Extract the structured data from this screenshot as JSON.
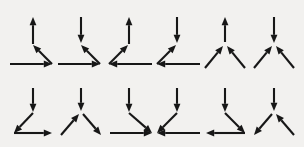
{
  "figure": {
    "background_color": "#f2f1ef",
    "stroke_color": "#171717",
    "stroke_width": 2.1,
    "canvas": {
      "width": 304,
      "height": 147
    },
    "rows": 2,
    "columns": 6,
    "item_count": 12
  },
  "items": [
    {
      "index": 1,
      "row": 1,
      "column": 1,
      "name": "junction-1",
      "vertex": {
        "x": 52,
        "y": 64
      },
      "segments": [
        {
          "name": "vertical-up-arrow",
          "direction": "up",
          "from": [
            33,
            44
          ],
          "to": [
            33,
            17
          ],
          "head": "end"
        },
        {
          "name": "diagonal-up-left-arrow",
          "direction": "up-left",
          "from": [
            52,
            64
          ],
          "to": [
            33,
            45
          ],
          "head": "end"
        },
        {
          "name": "horizontal-right-arrow",
          "direction": "right",
          "from": [
            10,
            64
          ],
          "to": [
            52,
            64
          ],
          "head": "end"
        }
      ]
    },
    {
      "index": 2,
      "row": 1,
      "column": 2,
      "name": "junction-2",
      "vertex": {
        "x": 100,
        "y": 64
      },
      "segments": [
        {
          "name": "vertical-down-arrow",
          "direction": "down",
          "from": [
            81,
            17
          ],
          "to": [
            81,
            43
          ],
          "head": "end"
        },
        {
          "name": "diagonal-up-left-arrow",
          "direction": "up-left",
          "from": [
            100,
            64
          ],
          "to": [
            81,
            45
          ],
          "head": "end"
        },
        {
          "name": "horizontal-right-arrow",
          "direction": "right",
          "from": [
            58,
            64
          ],
          "to": [
            100,
            64
          ],
          "head": "end"
        }
      ]
    },
    {
      "index": 3,
      "row": 1,
      "column": 3,
      "name": "junction-3",
      "vertex": {
        "x": 109,
        "y": 64
      },
      "segments": [
        {
          "name": "vertical-up-arrow",
          "direction": "up",
          "from": [
            129,
            44
          ],
          "to": [
            129,
            17
          ],
          "head": "end"
        },
        {
          "name": "diagonal-up-right-arrow",
          "direction": "up-right",
          "from": [
            109,
            64
          ],
          "to": [
            128,
            45
          ],
          "head": "end"
        },
        {
          "name": "horizontal-left-arrow",
          "direction": "left",
          "from": [
            152,
            64
          ],
          "to": [
            109,
            64
          ],
          "head": "end"
        }
      ]
    },
    {
      "index": 4,
      "row": 1,
      "column": 4,
      "name": "junction-4",
      "vertex": {
        "x": 157,
        "y": 64
      },
      "segments": [
        {
          "name": "vertical-down-arrow",
          "direction": "down",
          "from": [
            177,
            17
          ],
          "to": [
            177,
            43
          ],
          "head": "end"
        },
        {
          "name": "diagonal-up-right-arrow",
          "direction": "up-right",
          "from": [
            157,
            64
          ],
          "to": [
            176,
            45
          ],
          "head": "end"
        },
        {
          "name": "horizontal-left-arrow",
          "direction": "left",
          "from": [
            200,
            64
          ],
          "to": [
            157,
            64
          ],
          "head": "end"
        }
      ]
    },
    {
      "index": 5,
      "row": 1,
      "column": 5,
      "name": "junction-5",
      "vertex": {
        "x": 225,
        "y": 44
      },
      "segments": [
        {
          "name": "vertical-up-arrow",
          "direction": "up",
          "from": [
            225,
            42
          ],
          "to": [
            225,
            17
          ],
          "head": "end"
        },
        {
          "name": "diagonal-up-right-arrow",
          "direction": "up-right",
          "from": [
            205,
            68
          ],
          "to": [
            223,
            46
          ],
          "head": "end"
        },
        {
          "name": "diagonal-up-left-arrow",
          "direction": "up-left",
          "from": [
            245,
            68
          ],
          "to": [
            227,
            46
          ],
          "head": "end"
        }
      ]
    },
    {
      "index": 6,
      "row": 1,
      "column": 6,
      "name": "junction-6",
      "vertex": {
        "x": 274,
        "y": 44
      },
      "segments": [
        {
          "name": "vertical-down-arrow",
          "direction": "down",
          "from": [
            274,
            17
          ],
          "to": [
            274,
            43
          ],
          "head": "end"
        },
        {
          "name": "diagonal-up-right-arrow",
          "direction": "up-right",
          "from": [
            254,
            68
          ],
          "to": [
            272,
            46
          ],
          "head": "end"
        },
        {
          "name": "diagonal-up-left-arrow",
          "direction": "up-left",
          "from": [
            294,
            68
          ],
          "to": [
            276,
            46
          ],
          "head": "end"
        }
      ]
    },
    {
      "index": 7,
      "row": 2,
      "column": 1,
      "name": "junction-7",
      "vertex": {
        "x": 14,
        "y": 133
      },
      "segments": [
        {
          "name": "vertical-down-arrow",
          "direction": "down",
          "from": [
            33,
            88
          ],
          "to": [
            33,
            112
          ],
          "head": "end"
        },
        {
          "name": "diagonal-down-left-arrow",
          "direction": "down-left",
          "from": [
            33,
            113
          ],
          "to": [
            14,
            133
          ],
          "head": "end"
        },
        {
          "name": "horizontal-right-arrow",
          "direction": "right",
          "from": [
            14,
            133
          ],
          "to": [
            52,
            133
          ],
          "head": "end"
        }
      ]
    },
    {
      "index": 8,
      "row": 2,
      "column": 2,
      "name": "junction-8",
      "vertex": {
        "x": 81,
        "y": 113
      },
      "segments": [
        {
          "name": "vertical-down-arrow",
          "direction": "down",
          "from": [
            81,
            88
          ],
          "to": [
            81,
            111
          ],
          "head": "end"
        },
        {
          "name": "diagonal-up-right-arrow",
          "direction": "up-right",
          "from": [
            61,
            135
          ],
          "to": [
            79,
            114
          ],
          "head": "end"
        },
        {
          "name": "diagonal-down-right-arrow",
          "direction": "down-right",
          "from": [
            83,
            114
          ],
          "to": [
            101,
            135
          ],
          "head": "end"
        }
      ]
    },
    {
      "index": 9,
      "row": 2,
      "column": 3,
      "name": "junction-9",
      "vertex": {
        "x": 152,
        "y": 133
      },
      "segments": [
        {
          "name": "vertical-down-arrow",
          "direction": "down",
          "from": [
            129,
            88
          ],
          "to": [
            129,
            112
          ],
          "head": "end"
        },
        {
          "name": "diagonal-down-right-arrow",
          "direction": "down-right",
          "from": [
            129,
            113
          ],
          "to": [
            152,
            133
          ],
          "head": "end"
        },
        {
          "name": "horizontal-right-arrow",
          "direction": "right",
          "from": [
            110,
            133
          ],
          "to": [
            152,
            133
          ],
          "head": "end"
        }
      ]
    },
    {
      "index": 10,
      "row": 2,
      "column": 4,
      "name": "junction-10",
      "vertex": {
        "x": 157,
        "y": 133
      },
      "segments": [
        {
          "name": "vertical-down-arrow",
          "direction": "down",
          "from": [
            177,
            88
          ],
          "to": [
            177,
            112
          ],
          "head": "end"
        },
        {
          "name": "diagonal-down-left-arrow",
          "direction": "down-left",
          "from": [
            177,
            113
          ],
          "to": [
            157,
            133
          ],
          "head": "end"
        },
        {
          "name": "horizontal-left-arrow",
          "direction": "left",
          "from": [
            200,
            133
          ],
          "to": [
            157,
            133
          ],
          "head": "end"
        }
      ]
    },
    {
      "index": 11,
      "row": 2,
      "column": 5,
      "name": "junction-11",
      "vertex": {
        "x": 245,
        "y": 133
      },
      "segments": [
        {
          "name": "vertical-down-arrow",
          "direction": "down",
          "from": [
            225,
            88
          ],
          "to": [
            225,
            112
          ],
          "head": "end"
        },
        {
          "name": "diagonal-down-right-arrow",
          "direction": "down-right",
          "from": [
            225,
            113
          ],
          "to": [
            245,
            133
          ],
          "head": "end"
        },
        {
          "name": "horizontal-left-arrow",
          "direction": "left",
          "from": [
            245,
            133
          ],
          "to": [
            206,
            133
          ],
          "head": "end"
        }
      ]
    },
    {
      "index": 12,
      "row": 2,
      "column": 6,
      "name": "junction-12",
      "vertex": {
        "x": 274,
        "y": 113
      },
      "segments": [
        {
          "name": "vertical-down-arrow",
          "direction": "down",
          "from": [
            274,
            88
          ],
          "to": [
            274,
            111
          ],
          "head": "end"
        },
        {
          "name": "diagonal-down-left-arrow",
          "direction": "down-left",
          "from": [
            272,
            114
          ],
          "to": [
            254,
            135
          ],
          "head": "end"
        },
        {
          "name": "diagonal-up-left-arrow",
          "direction": "up-left",
          "from": [
            294,
            135
          ],
          "to": [
            276,
            114
          ],
          "head": "end"
        }
      ]
    }
  ]
}
